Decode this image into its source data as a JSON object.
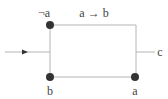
{
  "diagram": {
    "type": "switching-circuit",
    "labels": {
      "top_left": "¬a",
      "top_edge": "a → b",
      "bottom_left": "b",
      "bottom_right": "a",
      "output": "c"
    },
    "colors": {
      "wire": "#b4b4b4",
      "node": "#333333",
      "text": "#444444"
    }
  }
}
